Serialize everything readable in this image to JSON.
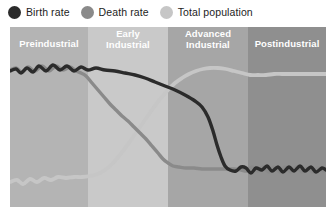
{
  "legend": {
    "items": [
      {
        "label": "Birth rate",
        "color": "#2b2b2b",
        "icon": "circle-marker-icon"
      },
      {
        "label": "Death rate",
        "color": "#8a8a8a",
        "icon": "circle-marker-icon"
      },
      {
        "label": "Total population",
        "color": "#c6c6c6",
        "icon": "circle-marker-icon"
      }
    ]
  },
  "chart_data": {
    "type": "line",
    "title": "",
    "xlabel": "",
    "ylabel": "",
    "xlim": [
      0,
      316
    ],
    "ylim": [
      0,
      180
    ],
    "grid": false,
    "legend_position": "top-left",
    "stages": [
      {
        "label": "Preindustrial",
        "lines": [
          "Preindustrial"
        ],
        "x_start": 0,
        "x_end": 78,
        "color": "#b4b4b4"
      },
      {
        "label": "Early Industrial",
        "lines": [
          "Early",
          "Industrial"
        ],
        "x_start": 78,
        "x_end": 158,
        "color": "#c9c9c9"
      },
      {
        "label": "Advanced Industrial",
        "lines": [
          "Advanced",
          "Industrial"
        ],
        "x_start": 158,
        "x_end": 238,
        "color": "#a6a6a6"
      },
      {
        "label": "Postindustrial",
        "lines": [
          "Postindustrial"
        ],
        "x_start": 238,
        "x_end": 316,
        "color": "#8f8f8f"
      }
    ],
    "series": [
      {
        "name": "Birth rate",
        "color": "#2b2b2b",
        "width": 3.4,
        "points": [
          [
            0,
            44
          ],
          [
            6,
            42
          ],
          [
            11,
            46
          ],
          [
            17,
            41
          ],
          [
            23,
            45
          ],
          [
            29,
            39
          ],
          [
            36,
            44
          ],
          [
            43,
            38
          ],
          [
            50,
            43
          ],
          [
            57,
            39
          ],
          [
            64,
            44
          ],
          [
            71,
            40
          ],
          [
            78,
            43
          ],
          [
            86,
            41
          ],
          [
            95,
            43
          ],
          [
            105,
            44
          ],
          [
            115,
            46
          ],
          [
            125,
            48
          ],
          [
            135,
            51
          ],
          [
            145,
            55
          ],
          [
            155,
            59
          ],
          [
            165,
            63
          ],
          [
            175,
            68
          ],
          [
            185,
            74
          ],
          [
            192,
            80
          ],
          [
            198,
            90
          ],
          [
            203,
            104
          ],
          [
            207,
            118
          ],
          [
            211,
            130
          ],
          [
            215,
            139
          ],
          [
            220,
            143
          ],
          [
            226,
            144
          ],
          [
            231,
            140
          ],
          [
            236,
            141
          ],
          [
            241,
            146
          ],
          [
            246,
            141
          ],
          [
            252,
            143
          ],
          [
            257,
            139
          ],
          [
            262,
            144
          ],
          [
            268,
            140
          ],
          [
            273,
            145
          ],
          [
            279,
            140
          ],
          [
            284,
            144
          ],
          [
            290,
            139
          ],
          [
            295,
            144
          ],
          [
            301,
            140
          ],
          [
            306,
            145
          ],
          [
            312,
            141
          ],
          [
            316,
            143
          ]
        ]
      },
      {
        "name": "Death rate",
        "color": "#8a8a8a",
        "width": 3.4,
        "points": [
          [
            0,
            43
          ],
          [
            6,
            41
          ],
          [
            12,
            45
          ],
          [
            18,
            40
          ],
          [
            25,
            44
          ],
          [
            32,
            39
          ],
          [
            39,
            44
          ],
          [
            46,
            39
          ],
          [
            53,
            43
          ],
          [
            60,
            40
          ],
          [
            66,
            44
          ],
          [
            71,
            46
          ],
          [
            76,
            49
          ],
          [
            82,
            56
          ],
          [
            88,
            63
          ],
          [
            94,
            70
          ],
          [
            100,
            77
          ],
          [
            106,
            83
          ],
          [
            112,
            89
          ],
          [
            118,
            94
          ],
          [
            124,
            100
          ],
          [
            130,
            106
          ],
          [
            136,
            112
          ],
          [
            142,
            119
          ],
          [
            148,
            126
          ],
          [
            153,
            132
          ],
          [
            158,
            136
          ],
          [
            163,
            139
          ],
          [
            169,
            140
          ],
          [
            176,
            141
          ],
          [
            184,
            141
          ],
          [
            192,
            142
          ],
          [
            200,
            142
          ],
          [
            208,
            142
          ],
          [
            216,
            142
          ],
          [
            224,
            142
          ],
          [
            231,
            143
          ],
          [
            237,
            144
          ],
          [
            242,
            140
          ],
          [
            248,
            144
          ],
          [
            253,
            140
          ],
          [
            259,
            145
          ],
          [
            264,
            140
          ],
          [
            270,
            145
          ],
          [
            275,
            140
          ],
          [
            281,
            145
          ],
          [
            286,
            140
          ],
          [
            292,
            145
          ],
          [
            297,
            141
          ],
          [
            303,
            145
          ],
          [
            308,
            141
          ],
          [
            314,
            144
          ],
          [
            316,
            143
          ]
        ]
      },
      {
        "name": "Total population",
        "color": "#c6c6c6",
        "width": 3.8,
        "points": [
          [
            0,
            155
          ],
          [
            7,
            153
          ],
          [
            13,
            157
          ],
          [
            20,
            152
          ],
          [
            27,
            155
          ],
          [
            34,
            151
          ],
          [
            41,
            153
          ],
          [
            48,
            150
          ],
          [
            56,
            151
          ],
          [
            64,
            150
          ],
          [
            72,
            150
          ],
          [
            80,
            149
          ],
          [
            88,
            147
          ],
          [
            95,
            143
          ],
          [
            102,
            137
          ],
          [
            109,
            129
          ],
          [
            116,
            120
          ],
          [
            123,
            110
          ],
          [
            130,
            100
          ],
          [
            137,
            90
          ],
          [
            144,
            80
          ],
          [
            151,
            71
          ],
          [
            158,
            63
          ],
          [
            165,
            56
          ],
          [
            172,
            51
          ],
          [
            179,
            47
          ],
          [
            186,
            44
          ],
          [
            193,
            42
          ],
          [
            200,
            41
          ],
          [
            208,
            41
          ],
          [
            216,
            42
          ],
          [
            224,
            44
          ],
          [
            232,
            46
          ],
          [
            240,
            48
          ],
          [
            248,
            48
          ],
          [
            256,
            48
          ],
          [
            264,
            47
          ],
          [
            272,
            47
          ],
          [
            280,
            47
          ],
          [
            288,
            47
          ],
          [
            296,
            47
          ],
          [
            304,
            47
          ],
          [
            310,
            47
          ],
          [
            316,
            47
          ]
        ]
      }
    ]
  }
}
